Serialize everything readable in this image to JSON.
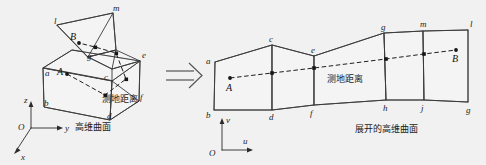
{
  "figure": {
    "caption_left": "高维曲面",
    "caption_right": "展开的高维曲面",
    "geodesic_label_left": "测地距离",
    "geodesic_label_right": "测地距离",
    "transform_arrow": "double-right-arrow",
    "colors": {
      "background": "#f1f1f1",
      "stroke": "#3a3a3a",
      "text": "#1a1a1a",
      "dash": "#1d1d1d",
      "arrow": "#55555a"
    }
  },
  "left_panel": {
    "name": "high-dimensional-surface",
    "axes": {
      "origin": "O",
      "x": "x",
      "y": "y",
      "z": "z"
    },
    "points": {
      "start": "A",
      "end": "B"
    },
    "vertices": [
      {
        "id": "a",
        "label": "a"
      },
      {
        "id": "b",
        "label": "b"
      },
      {
        "id": "c",
        "label": "c"
      },
      {
        "id": "d",
        "label": "d"
      },
      {
        "id": "e",
        "label": "e"
      },
      {
        "id": "f",
        "label": "f"
      },
      {
        "id": "g",
        "label": "g"
      },
      {
        "id": "l",
        "label": "l"
      },
      {
        "id": "m",
        "label": "m"
      }
    ]
  },
  "right_panel": {
    "name": "unfolded-high-dimensional-surface",
    "axes": {
      "origin": "O",
      "u": "u",
      "v": "v"
    },
    "points": {
      "start": "A",
      "end": "B"
    },
    "vertices_top": [
      {
        "id": "a",
        "label": "a"
      },
      {
        "id": "c",
        "label": "c"
      },
      {
        "id": "e",
        "label": "e"
      },
      {
        "id": "g",
        "label": "g"
      },
      {
        "id": "m",
        "label": "m"
      },
      {
        "id": "l",
        "label": "l"
      }
    ],
    "vertices_bottom": [
      {
        "id": "b",
        "label": "b"
      },
      {
        "id": "d",
        "label": "d"
      },
      {
        "id": "f",
        "label": "f"
      },
      {
        "id": "h",
        "label": "h"
      },
      {
        "id": "j",
        "label": "j"
      },
      {
        "id": "g2",
        "label": "g"
      }
    ]
  }
}
